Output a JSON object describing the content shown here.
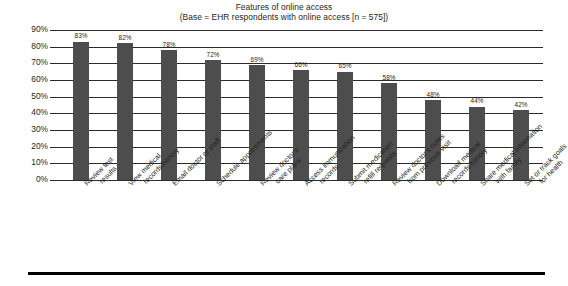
{
  "chart_data": {
    "type": "bar",
    "title": "Features of online access",
    "subtitle": "(Base = EHR respondents with online access [n = 575])",
    "xlabel": "",
    "ylabel": "",
    "ylim": [
      0,
      90
    ],
    "grid": true,
    "legend": "none",
    "orientation": "vertical",
    "value_suffix": "%",
    "bar_color": "#4d4d4d",
    "categories": [
      "Review test results",
      "View medical records/history",
      "Email doctor or staff",
      "Schedule appointments",
      "Review doctor's care plans",
      "Access immunization records",
      "Submit medication refill requests",
      "Review doctor's notes from previous visit",
      "Download medical records/history",
      "Share medical information with family",
      "Set or track goals for health"
    ],
    "category_lines": [
      [
        "Review test",
        "results"
      ],
      [
        "View medical",
        "records/history"
      ],
      [
        "Email doctor or staff"
      ],
      [
        "Schedule appointments"
      ],
      [
        "Review doctor's",
        "care plans"
      ],
      [
        "Access immunization",
        "records"
      ],
      [
        "Submit medication",
        "refill requests"
      ],
      [
        "Review doctor's notes",
        "from previous visit"
      ],
      [
        "Download medical",
        "records/history"
      ],
      [
        "Share medical information",
        "with family"
      ],
      [
        "Set or track goals",
        "for health"
      ]
    ],
    "values": [
      83,
      82,
      78,
      72,
      69,
      66,
      65,
      58,
      48,
      44,
      42
    ],
    "value_labels": [
      "83%",
      "82%",
      "78%",
      "72%",
      "69%",
      "66%",
      "65%",
      "58%",
      "48%",
      "44%",
      "42%"
    ],
    "yticks": [
      0,
      10,
      20,
      30,
      40,
      50,
      60,
      70,
      80,
      90
    ],
    "ytick_labels": [
      "0%",
      "10%",
      "20%",
      "30%",
      "40%",
      "50%",
      "60%",
      "70%",
      "80%",
      "90%"
    ]
  }
}
